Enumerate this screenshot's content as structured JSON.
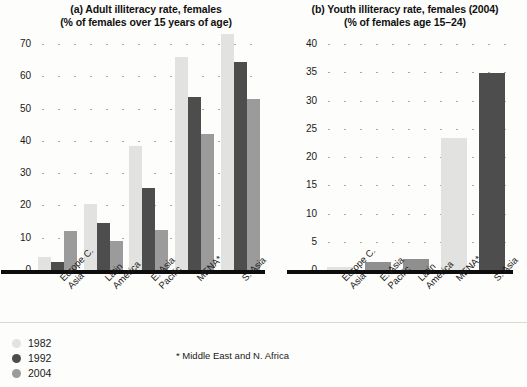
{
  "chart_data": [
    {
      "type": "bar",
      "panel": "a",
      "title": "(a) Adult illiteracy rate, females",
      "subtitle": "(% of females over 15 years of age)",
      "xlabel": "",
      "ylabel": "",
      "ylim": [
        0,
        70
      ],
      "yticks": [
        0,
        10,
        20,
        30,
        40,
        50,
        60,
        70
      ],
      "grid": true,
      "legend_position": "bottom-left",
      "categories": [
        "Europe C.\nAsia",
        "Latin\nAmerica",
        "E. Asia\nPacific",
        "MENA*",
        "S. Asia"
      ],
      "series": [
        {
          "name": "1982",
          "color": "#e2e2e0",
          "values": [
            4.0,
            20.5,
            38.5,
            66.0,
            73.0
          ]
        },
        {
          "name": "1992",
          "color": "#4d4d4d",
          "values": [
            2.5,
            14.5,
            25.5,
            53.5,
            64.5
          ]
        },
        {
          "name": "2004",
          "color": "#9b9b9b",
          "values": [
            12.0,
            9.0,
            12.5,
            42.0,
            53.0
          ]
        }
      ]
    },
    {
      "type": "bar",
      "panel": "b",
      "title": "(b) Youth illiteracy rate, females (2004)",
      "subtitle": "(% of females age 15–24)",
      "xlabel": "",
      "ylabel": "",
      "ylim": [
        0,
        40
      ],
      "yticks": [
        0,
        5,
        10,
        15,
        20,
        25,
        30,
        35,
        40
      ],
      "grid": true,
      "categories": [
        "Europe C.\nAsia",
        "E. Asia\nPacific",
        "Latin\nAmerica",
        "MENA*",
        "S. Asia"
      ],
      "series": [
        {
          "name": "2004",
          "color": "#9b9b9b",
          "values": [
            0.6,
            1.4,
            1.9,
            23.3,
            34.8
          ]
        }
      ],
      "bar_colors": [
        "#e2e2e0",
        "#8f8f8f",
        "#8f8f8f",
        "#e2e2e0",
        "#4d4d4d"
      ]
    }
  ],
  "legend": {
    "items": [
      {
        "label": "1982",
        "color": "#e2e2e0"
      },
      {
        "label": "1992",
        "color": "#4d4d4d"
      },
      {
        "label": "2004",
        "color": "#9b9b9b"
      }
    ]
  },
  "footnote": "* Middle East and N. Africa"
}
